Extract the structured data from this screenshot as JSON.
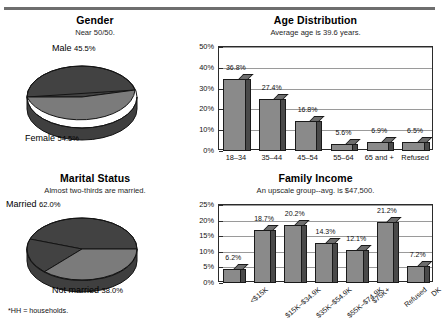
{
  "footnote": "*HH = households.",
  "panels": {
    "gender": {
      "title": "Gender",
      "subtitle": "Near 50/50.",
      "label_top": "Male",
      "pct_top": "45.5%",
      "label_bottom": "Female",
      "pct_bottom": "54.5%"
    },
    "marital": {
      "title": "Marital Status",
      "subtitle": "Almost two-thirds are married.",
      "label_top": "Married",
      "pct_top": "62.0%",
      "label_bottom": "Not married",
      "pct_bottom": "38.0%"
    },
    "age": {
      "title": "Age Distribution",
      "subtitle": "Average age is 39.6 years."
    },
    "income": {
      "title": "Family Income",
      "subtitle": "An upscale group--avg. is $47,500."
    }
  },
  "chart_data": [
    {
      "type": "pie",
      "title": "Gender",
      "subtitle": "Near 50/50.",
      "labels": [
        "Male",
        "Female"
      ],
      "values": [
        45.5,
        54.5
      ],
      "value_labels": [
        "45.5%",
        "54.5%"
      ],
      "colors": [
        "#4a4a4a",
        "#7d7d7d"
      ],
      "legend": "inline-callouts",
      "three_d": true
    },
    {
      "type": "pie",
      "title": "Marital Status",
      "subtitle": "Almost two-thirds are married.",
      "labels": [
        "Married",
        "Not married"
      ],
      "values": [
        62.0,
        38.0
      ],
      "value_labels": [
        "62.0%",
        "38.0%"
      ],
      "colors": [
        "#4a4a4a",
        "#7d7d7d"
      ],
      "legend": "inline-callouts",
      "three_d": true
    },
    {
      "type": "bar",
      "title": "Age Distribution",
      "subtitle": "Average age is 39.6 years.",
      "categories": [
        "18--34",
        "35--44",
        "45--54",
        "55--64",
        "65 and +",
        "Refused"
      ],
      "values": [
        36.8,
        27.4,
        16.8,
        5.6,
        6.9,
        6.5
      ],
      "value_labels": [
        "36.8%",
        "27.4%",
        "16.8%",
        "5.6%",
        "6.9%",
        "6.5%"
      ],
      "xlabel": "",
      "ylabel": "",
      "ylim": [
        0,
        50
      ],
      "yticks": [
        "0%",
        "10%",
        "20%",
        "30%",
        "40%",
        "50%"
      ],
      "ytick_values": [
        0,
        10,
        20,
        30,
        40,
        50
      ],
      "grid": true,
      "legend": "none"
    },
    {
      "type": "bar",
      "title": "Family Income",
      "subtitle": "An upscale group--avg. is $47,500.",
      "categories": [
        "<$15K",
        "$15K--$34.9K",
        "$35K--$54.9K",
        "$55K--$74.9K",
        "$75K+",
        "Refused",
        "DK"
      ],
      "values": [
        6.2,
        18.7,
        20.2,
        14.3,
        12.1,
        21.2,
        7.2
      ],
      "value_labels": [
        "6.2%",
        "18.7%",
        "20.2%",
        "14.3%",
        "12.1%",
        "21.2%",
        "7.2%"
      ],
      "xlabel": "",
      "ylabel": "",
      "ylim": [
        0,
        25
      ],
      "yticks": [
        "0%",
        "5%",
        "10%",
        "15%",
        "20%",
        "25%"
      ],
      "ytick_values": [
        0,
        5,
        10,
        15,
        20,
        25
      ],
      "grid": true,
      "legend": "none"
    }
  ]
}
